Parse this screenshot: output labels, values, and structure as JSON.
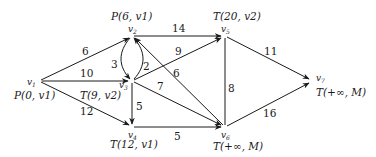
{
  "nodes": [
    {
      "id": "v1",
      "label": "v1",
      "x": 39,
      "y": 81,
      "mark": "P(0, v1)"
    },
    {
      "id": "v2",
      "label": "v2",
      "x": 132,
      "y": 36,
      "mark": "P(6, v1)"
    },
    {
      "id": "v3",
      "label": "v3",
      "x": 132,
      "y": 81,
      "mark": "T(9, v2)"
    },
    {
      "id": "v4",
      "label": "v4",
      "x": 132,
      "y": 127,
      "mark": "T(12, v1)"
    },
    {
      "id": "v5",
      "label": "v5",
      "x": 225,
      "y": 36,
      "mark": "T(20, v2)"
    },
    {
      "id": "v6",
      "label": "v6",
      "x": 225,
      "y": 127,
      "mark": "T(+∞, M)"
    },
    {
      "id": "v7",
      "label": "v7",
      "x": 313,
      "y": 81,
      "mark": "T(+∞, M)"
    }
  ],
  "edges": [
    {
      "from": "v1",
      "to": "v2",
      "weight": "6"
    },
    {
      "from": "v1",
      "to": "v3",
      "weight": "10"
    },
    {
      "from": "v1",
      "to": "v4",
      "weight": "12"
    },
    {
      "from": "v2",
      "to": "v3",
      "weight": "3"
    },
    {
      "from": "v3",
      "to": "v2",
      "weight": "2"
    },
    {
      "from": "v2",
      "to": "v5",
      "weight": "14"
    },
    {
      "from": "v3",
      "to": "v5",
      "weight": "9"
    },
    {
      "from": "v6",
      "to": "v2",
      "weight": "6"
    },
    {
      "from": "v3",
      "to": "v6",
      "weight": "7"
    },
    {
      "from": "v3",
      "to": "v4",
      "weight": "5"
    },
    {
      "from": "v4",
      "to": "v6",
      "weight": "5"
    },
    {
      "from": "v5",
      "to": "v6",
      "weight": "8"
    },
    {
      "from": "v5",
      "to": "v7",
      "weight": "11"
    },
    {
      "from": "v6",
      "to": "v7",
      "weight": "16"
    }
  ],
  "labels": {
    "v1_mark": "P(0, v1)",
    "v2_mark": "P(6, v1)",
    "v3_mark": "T(9, v2)",
    "v4_mark": "T(12, v1)",
    "v5_mark": "T(20, v2)",
    "v6_mark": "T(+∞, M)",
    "v7_mark": "T(+∞, M)",
    "w_v1v2": "6",
    "w_v1v3": "10",
    "w_v1v4": "12",
    "w_v2v3": "3",
    "w_v3v2": "2",
    "w_v2v5": "14",
    "w_v3v5": "9",
    "w_v6v2": "6",
    "w_v3v6": "7",
    "w_v3v4": "5",
    "w_v4v6": "5",
    "w_v5v6": "8",
    "w_v5v7": "11",
    "w_v6v7": "16"
  }
}
